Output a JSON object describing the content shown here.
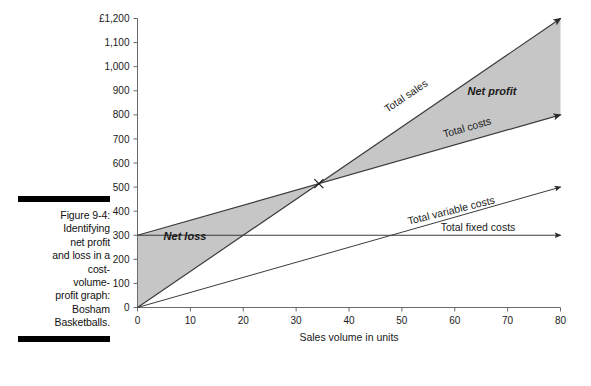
{
  "caption": {
    "figure_number": "Figure 9-4:",
    "line1": "Identifying",
    "line2": "net profit",
    "line3": "and loss in a",
    "line4": "cost-",
    "line5": "volume-",
    "line6": "profit graph:",
    "line7": "Bosham",
    "line8": "Basketballs."
  },
  "next_figure": {
    "y_axis_top_label": "£1,200"
  },
  "colors": {
    "shade": "#c6c6c6",
    "line": "#3b3b3b",
    "axis": "#6b6b6b",
    "text": "#1a1a1a",
    "rule": "#000000"
  },
  "chart_data": {
    "type": "line",
    "title": "",
    "xlabel": "Sales volume in units",
    "ylabel": "£1,200",
    "currency_symbol": "£",
    "xlim": [
      0,
      80
    ],
    "ylim": [
      0,
      1200
    ],
    "xticks": [
      0,
      10,
      20,
      30,
      40,
      50,
      60,
      70,
      80
    ],
    "xtick_labels": [
      "0",
      "10",
      "20",
      "30",
      "40",
      "50",
      "60",
      "70",
      "80"
    ],
    "yticks": [
      0,
      100,
      200,
      300,
      400,
      500,
      600,
      700,
      800,
      900,
      1000,
      1100,
      1200
    ],
    "ytick_labels": [
      "0",
      "100",
      "200",
      "300",
      "400",
      "500",
      "600",
      "700",
      "800",
      "900",
      "1,000",
      "1,100",
      "£1,200"
    ],
    "grid": false,
    "legend": "inline-labels",
    "series": [
      {
        "name": "Total sales",
        "label": "Total sales",
        "x": [
          0,
          80
        ],
        "values": [
          0,
          1200
        ],
        "slope_per_unit": 15,
        "intercept": 0,
        "arrow": true
      },
      {
        "name": "Total costs",
        "label": "Total costs",
        "x": [
          0,
          80
        ],
        "values": [
          300,
          800
        ],
        "slope_per_unit": 6.25,
        "intercept": 300,
        "arrow": true
      },
      {
        "name": "Total variable costs",
        "label": "Total variable costs",
        "x": [
          0,
          80
        ],
        "values": [
          0,
          500
        ],
        "slope_per_unit": 6.25,
        "intercept": 0,
        "arrow": true
      },
      {
        "name": "Total fixed costs",
        "label": "Total fixed costs",
        "x": [
          0,
          80
        ],
        "values": [
          300,
          300
        ],
        "slope_per_unit": 0,
        "intercept": 300,
        "arrow": true
      }
    ],
    "regions": [
      {
        "name": "net-loss",
        "label": "Net loss",
        "between": [
          "Total costs",
          "Total sales"
        ],
        "x_range": [
          0,
          34.3
        ],
        "shaded": true
      },
      {
        "name": "net-profit",
        "label": "Net profit",
        "between": [
          "Total costs",
          "Total sales"
        ],
        "x_range": [
          34.3,
          80
        ],
        "shaded": true
      }
    ],
    "annotations": [
      {
        "name": "break-even-point",
        "x": 34.3,
        "y": 514,
        "marker": "x"
      }
    ]
  }
}
